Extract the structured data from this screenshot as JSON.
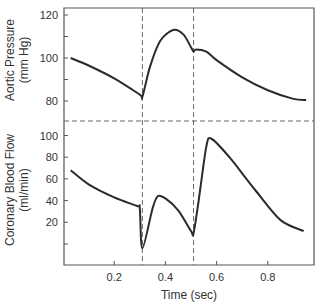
{
  "chart_data": [
    {
      "type": "line",
      "title": "",
      "ylabel": "Aortic Pressure (mm Hg)",
      "ylabel_lines": [
        "Aortic Pressure",
        "(mm Hg)"
      ],
      "xlabel": "Time (sec)",
      "ylim": [
        75,
        123
      ],
      "yticks": [
        120,
        110,
        100,
        90,
        80
      ],
      "ytick_labels": [
        "120",
        "",
        "100",
        "",
        "80"
      ],
      "series": [
        {
          "name": "Aortic Pressure",
          "x": [
            0.03,
            0.1,
            0.2,
            0.3,
            0.31,
            0.34,
            0.38,
            0.43,
            0.47,
            0.5,
            0.51,
            0.52,
            0.56,
            0.6,
            0.7,
            0.8,
            0.9,
            0.95
          ],
          "y": [
            100,
            96.5,
            90.5,
            83,
            82,
            96,
            108,
            113,
            111,
            105,
            103,
            104,
            103,
            99,
            91,
            85,
            81,
            80.5
          ]
        }
      ]
    },
    {
      "type": "line",
      "title": "",
      "ylabel": "Coronary Blood Flow (ml/min)",
      "ylabel_lines": [
        "Coronary Blood Flow",
        "(ml/min)"
      ],
      "xlabel": "Time (sec)",
      "ylim": [
        -10,
        110
      ],
      "yticks": [
        100,
        80,
        60,
        40,
        20,
        0
      ],
      "ytick_labels": [
        "100",
        "80",
        "60",
        "40",
        "20",
        ""
      ],
      "series": [
        {
          "name": "Coronary Blood Flow",
          "x": [
            0.03,
            0.1,
            0.2,
            0.29,
            0.3,
            0.31,
            0.35,
            0.37,
            0.4,
            0.45,
            0.5,
            0.51,
            0.53,
            0.56,
            0.58,
            0.65,
            0.75,
            0.85,
            0.94
          ],
          "y": [
            68,
            55,
            43,
            35,
            33,
            -4,
            33,
            44,
            42,
            31,
            12,
            10,
            40,
            90,
            97,
            80,
            50,
            22,
            12
          ]
        }
      ]
    }
  ],
  "shared_x_axis": {
    "label": "Time (sec)",
    "xlim": [
      0,
      0.97
    ],
    "ticks": [
      0.2,
      0.4,
      0.6,
      0.8
    ],
    "tick_labels": [
      "0.2",
      "0.4",
      "0.6",
      "0.8"
    ]
  },
  "annotations": {
    "vertical_dashed_lines_x": [
      0.31,
      0.51
    ],
    "horizontal_divider": "dashed line separating upper and lower panels"
  },
  "colors": {
    "line": "#2b2b2b",
    "axis": "#555555",
    "dashed": "#666666"
  }
}
